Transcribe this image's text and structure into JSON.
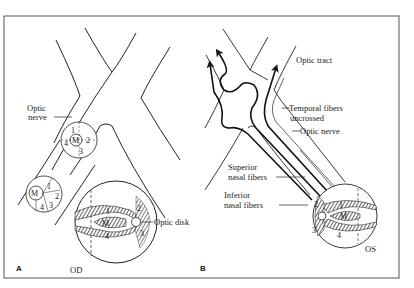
{
  "figure": {
    "panel_a": {
      "letter": "A",
      "labels": {
        "optic_nerve_line1": "Optic",
        "optic_nerve_line2": "nerve",
        "optic_disk": "Optic disk",
        "eye": "OD"
      },
      "quadrant_circle_upper": {
        "q1": "1",
        "q2": "2",
        "q3": "3",
        "q4": "4",
        "center": "M"
      },
      "quadrant_circle_lower": {
        "q1": "1",
        "q2": "2",
        "q3": "3",
        "q4": "4",
        "center": "M"
      },
      "retina": {
        "q1": "1",
        "q2": "2",
        "q3": "3",
        "q4": "4",
        "center": "M"
      }
    },
    "panel_b": {
      "letter": "B",
      "labels": {
        "optic_tract": "Optic tract",
        "temporal_line1": "Temporal fibers",
        "temporal_line2": "uncrossed",
        "optic_nerve": "Optic nerve",
        "superior_line1": "Superior",
        "superior_line2": "nasal fibers",
        "inferior_line1": "Inferior",
        "inferior_line2": "nasal fibers",
        "eye": "OS"
      },
      "retina": {
        "q1": "1",
        "q2": "2",
        "q3": "3",
        "q4": "4",
        "center": "M"
      }
    },
    "colors": {
      "ink": "#1a1a1a",
      "border": "#555555",
      "background": "#ffffff"
    }
  }
}
